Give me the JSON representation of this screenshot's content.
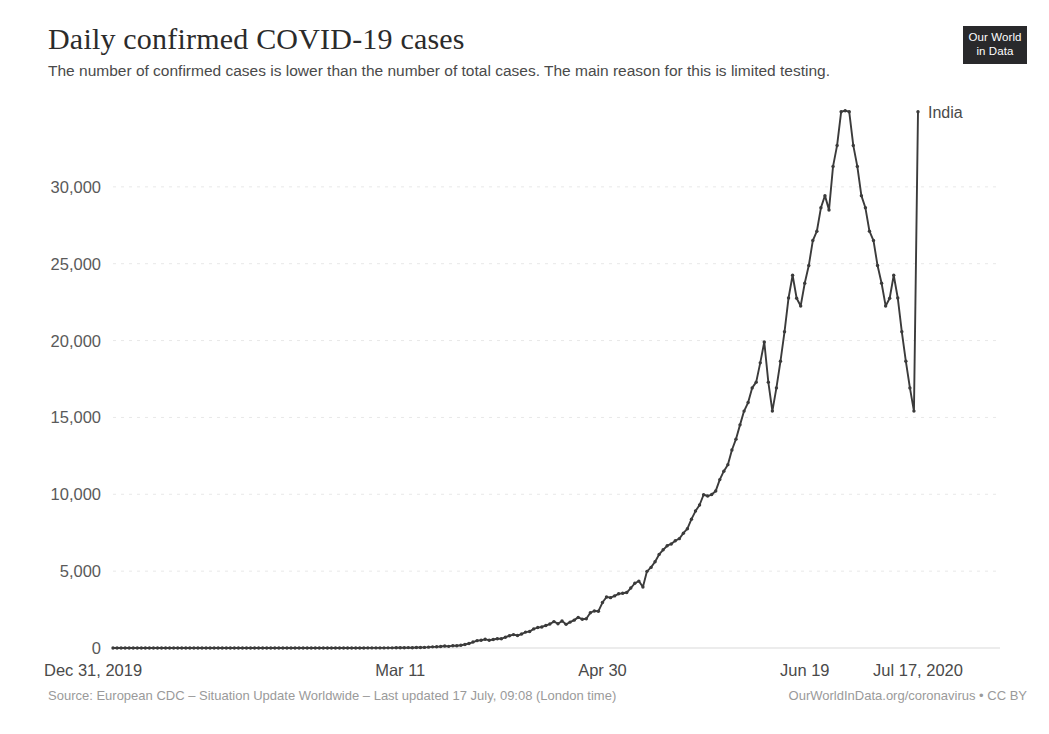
{
  "header": {
    "title": "Daily confirmed COVID-19 cases",
    "subtitle": "The number of confirmed cases is lower than the number of total cases. The main reason for this is limited testing."
  },
  "logo": {
    "line1": "Our World",
    "line2": "in Data",
    "background": "#29292b",
    "text_color": "#ffffff"
  },
  "footer": {
    "source": "Source: European CDC – Situation Update Worldwide – Last updated 17 July, 09:08 (London time)",
    "credit": "OurWorldInData.org/coronavirus • CC BY"
  },
  "chart_data": {
    "type": "line",
    "title": "Daily confirmed COVID-19 cases",
    "subtitle": "The number of confirmed cases is lower than the number of total cases. The main reason for this is limited testing.",
    "xlabel": "",
    "ylabel": "",
    "grid": true,
    "legend_position": "end-of-line",
    "line_color": "#3b3b3b",
    "marker": "dot",
    "ylim": [
      0,
      35000
    ],
    "ytick_values": [
      0,
      5000,
      10000,
      15000,
      20000,
      25000,
      30000
    ],
    "ytick_labels": [
      "0",
      "5,000",
      "10,000",
      "15,000",
      "20,000",
      "25,000",
      "30,000"
    ],
    "xlim": [
      "2019-12-31",
      "2020-07-17"
    ],
    "xtick_labels": [
      "Dec 31, 2019",
      "Mar 11",
      "Apr 30",
      "Jun 19",
      "Jul 17, 2020"
    ],
    "xtick_indices": [
      0,
      71,
      121,
      171,
      199
    ],
    "series": [
      {
        "name": "India",
        "label": "India",
        "color": "#3b3b3b",
        "x_start": "2019-12-31",
        "x_end": "2020-07-17",
        "values": [
          0,
          0,
          0,
          0,
          0,
          0,
          0,
          0,
          0,
          0,
          0,
          0,
          0,
          0,
          0,
          0,
          0,
          0,
          0,
          0,
          0,
          0,
          0,
          0,
          0,
          0,
          0,
          0,
          0,
          0,
          1,
          0,
          0,
          1,
          0,
          0,
          1,
          0,
          0,
          0,
          0,
          0,
          0,
          0,
          0,
          0,
          0,
          0,
          0,
          0,
          0,
          0,
          0,
          0,
          0,
          0,
          0,
          0,
          0,
          0,
          2,
          1,
          3,
          5,
          5,
          6,
          8,
          8,
          11,
          9,
          12,
          15,
          18,
          25,
          20,
          28,
          37,
          39,
          54,
          75,
          84,
          99,
          131,
          106,
          151,
          146,
          176,
          228,
          291,
          386,
          479,
          505,
          565,
          508,
          553,
          604,
          601,
          704,
          796,
          871,
          813,
          909,
          1035,
          1076,
          1243,
          1329,
          1370,
          1463,
          1560,
          1718,
          1580,
          1755,
          1540,
          1684,
          1813,
          1990,
          1872,
          1902,
          2293,
          2411,
          2395,
          2958,
          3320,
          3277,
          3390,
          3525,
          3561,
          3607,
          3900,
          4213,
          4353,
          3970,
          4987,
          5242,
          5611,
          6088,
          6387,
          6654,
          6767,
          6977,
          7113,
          7466,
          7761,
          8380,
          8909,
          9304,
          9971,
          9887,
          9983,
          10218,
          10956,
          11502,
          11929,
          12881,
          13586,
          14516,
          15413,
          15968,
          16922,
          17296,
          18552,
          19906,
          17296,
          15413,
          16922,
          18653,
          20572,
          22771,
          24248,
          22752,
          22252,
          23727,
          24879,
          26506,
          27114,
          28637,
          29429,
          28498,
          31330,
          32695,
          34884,
          34956,
          34884,
          32695,
          31330,
          29429,
          28637,
          27114,
          26506,
          24879,
          23727,
          22252,
          22752,
          24248,
          22771,
          20572,
          18653,
          16922,
          15413,
          34884
        ],
        "peak_value": 34884,
        "final_value": 34884
      }
    ],
    "annotations": [
      {
        "text": "India",
        "position": "right of final point"
      }
    ]
  }
}
